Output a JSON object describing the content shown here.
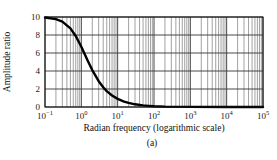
{
  "chart_data": {
    "type": "line",
    "title": "",
    "xlabel": "Radian frequency (logarithmic scale)",
    "ylabel": "Amplitude ratio",
    "caption": "(a)",
    "xscale": "log",
    "xlim": [
      0.1,
      100000
    ],
    "ylim": [
      0,
      10
    ],
    "grid": true,
    "legend": null,
    "x_tick_labels": [
      {
        "base": "10",
        "exp": "−1",
        "value": 0.1
      },
      {
        "base": "10",
        "exp": "0",
        "value": 1
      },
      {
        "base": "10",
        "exp": "1",
        "value": 10
      },
      {
        "base": "10",
        "exp": "2",
        "value": 100
      },
      {
        "base": "10",
        "exp": "3",
        "value": 1000
      },
      {
        "base": "10",
        "exp": "4",
        "value": 10000
      },
      {
        "base": "10",
        "exp": "5",
        "value": 100000
      }
    ],
    "y_tick_labels": [
      "0",
      "2",
      "4",
      "6",
      "8",
      "10"
    ],
    "y_ticks": [
      0,
      2,
      4,
      6,
      8,
      10
    ],
    "series": [
      {
        "name": "Amplitude ratio",
        "color": "#000000",
        "x": [
          0.1,
          0.2,
          0.3,
          0.5,
          0.7,
          1,
          1.5,
          2,
          3,
          4,
          5,
          7,
          10,
          15,
          20,
          30,
          50,
          70,
          100,
          200,
          1000,
          10000,
          100000
        ],
        "y": [
          9.94,
          9.76,
          9.49,
          8.74,
          7.89,
          6.69,
          5.15,
          4.1,
          2.87,
          2.19,
          1.77,
          1.28,
          0.9,
          0.6,
          0.45,
          0.3,
          0.18,
          0.13,
          0.09,
          0.045,
          0.01,
          0.0,
          0.0
        ]
      }
    ]
  }
}
